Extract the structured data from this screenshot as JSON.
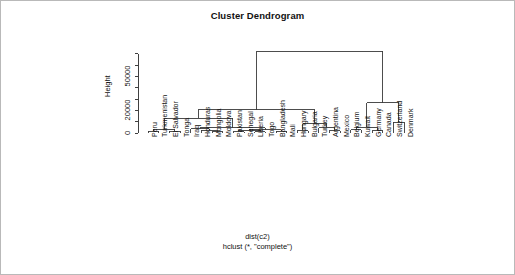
{
  "plot": {
    "title": "Cluster Dendrogram",
    "caption_line1": "dist(c2)",
    "caption_line2": "hclust (*, \"complete\")",
    "ylabel": "Height",
    "axis_color": "#2b2b2b",
    "line_color": "#3a3a3a",
    "frame_color": "#b9b9b9",
    "background": "#ffffff"
  },
  "chart_data": {
    "type": "dendrogram",
    "title": "Cluster Dendrogram",
    "xlabel": "dist(c2)",
    "ylabel": "Height",
    "method": "complete",
    "distance": "dist(c2)",
    "ylim": [
      0,
      75000
    ],
    "yticks": [
      0,
      10000,
      20000,
      30000,
      40000,
      50000,
      60000,
      70000
    ],
    "ytick_labels_shown": [
      "0",
      "20000",
      "50000"
    ],
    "grid": false,
    "legend": "none",
    "leaves": [
      "Peru",
      "Turkmenistan",
      "El Salvador",
      "Tonga",
      "Iraq",
      "Honduras",
      "Mongolia",
      "Moldova",
      "Pakistan",
      "Senegal",
      "Liberia",
      "Togo",
      "Bangladesh",
      "Mali",
      "Hungary",
      "Bulgaria",
      "Turkey",
      "Argentina",
      "Mexico",
      "Belgium",
      "Kuwait",
      "Germany",
      "Canada",
      "Switzerland",
      "Denmark"
    ],
    "merges": [
      {
        "id": "m1",
        "left": "Peru",
        "right": "Turkmenistan",
        "height": 1400
      },
      {
        "id": "m2",
        "left": "El Salvador",
        "right": "Tonga",
        "height": 1400
      },
      {
        "id": "m3",
        "left": "m1",
        "right": "m2",
        "height": 3300
      },
      {
        "id": "m4",
        "left": "Mongolia",
        "right": "Moldova",
        "height": 1300
      },
      {
        "id": "m5",
        "left": "Honduras",
        "right": "m4",
        "height": 2400
      },
      {
        "id": "m6",
        "left": "Iraq",
        "right": "m5",
        "height": 3600
      },
      {
        "id": "m7",
        "left": "Pakistan",
        "right": "Senegal",
        "height": 1200
      },
      {
        "id": "m8",
        "left": "Liberia",
        "right": "Togo",
        "height": 1300
      },
      {
        "id": "m9",
        "left": "m7",
        "right": "m8",
        "height": 2600
      },
      {
        "id": "m10",
        "left": "Bangladesh",
        "right": "Mali",
        "height": 1500
      },
      {
        "id": "m11",
        "left": "m9",
        "right": "m10",
        "height": 3000
      },
      {
        "id": "m12",
        "left": "m6",
        "right": "m11",
        "height": 4600
      },
      {
        "id": "m13",
        "left": "m3",
        "right": "m12",
        "height": 13000
      },
      {
        "id": "m14",
        "left": "Hungary",
        "right": "Bulgaria",
        "height": 2000
      },
      {
        "id": "m15",
        "left": "Argentina",
        "right": "Mexico",
        "height": 2200
      },
      {
        "id": "m16",
        "left": "Turkey",
        "right": "m15",
        "height": 4800
      },
      {
        "id": "m17",
        "left": "m14",
        "right": "m16",
        "height": 8300
      },
      {
        "id": "m18",
        "left": "m13",
        "right": "m17",
        "height": 20500
      },
      {
        "id": "m19",
        "left": "Belgium",
        "right": "Kuwait",
        "height": 3000
      },
      {
        "id": "m20",
        "left": "Germany",
        "right": "Canada",
        "height": 2000
      },
      {
        "id": "m21",
        "left": "m19",
        "right": "m20",
        "height": 5000
      },
      {
        "id": "m22",
        "left": "Switzerland",
        "right": "Denmark",
        "height": 9500
      },
      {
        "id": "m23",
        "left": "m21",
        "right": "m22",
        "height": 26500
      },
      {
        "id": "m24",
        "left": "m18",
        "right": "m23",
        "height": 72000
      }
    ]
  }
}
